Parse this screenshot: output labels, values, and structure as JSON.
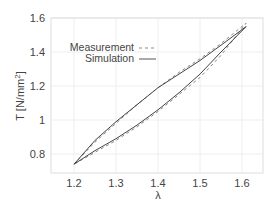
{
  "chart_data": {
    "type": "line",
    "title": "",
    "xlabel": "λ",
    "ylabel": "T [N/mm²]",
    "xlim": [
      1.15,
      1.65
    ],
    "ylim": [
      0.7,
      1.6
    ],
    "xticks": [
      "1.2",
      "1.3",
      "1.4",
      "1.5",
      "1.6"
    ],
    "yticks": [
      "0.8",
      "1",
      "1.2",
      "1.4",
      "1.6"
    ],
    "grid": true,
    "legend_position": "upper-left-inside",
    "series": [
      {
        "name": "Measurement",
        "style": "dashed",
        "loading": {
          "x": [
            1.2,
            1.25,
            1.3,
            1.35,
            1.4,
            1.45,
            1.5,
            1.55,
            1.61
          ],
          "y": [
            0.74,
            0.87,
            0.98,
            1.09,
            1.19,
            1.28,
            1.36,
            1.45,
            1.57
          ]
        },
        "unloading": {
          "x": [
            1.61,
            1.55,
            1.5,
            1.45,
            1.4,
            1.35,
            1.3,
            1.25,
            1.2
          ],
          "y": [
            1.57,
            1.38,
            1.25,
            1.15,
            1.05,
            0.96,
            0.88,
            0.81,
            0.74
          ]
        }
      },
      {
        "name": "Simulation",
        "style": "solid",
        "loading": {
          "x": [
            1.2,
            1.25,
            1.3,
            1.35,
            1.4,
            1.45,
            1.5,
            1.55,
            1.61
          ],
          "y": [
            0.74,
            0.88,
            0.99,
            1.09,
            1.19,
            1.27,
            1.35,
            1.44,
            1.55
          ]
        },
        "unloading": {
          "x": [
            1.61,
            1.55,
            1.5,
            1.45,
            1.4,
            1.35,
            1.3,
            1.25,
            1.2
          ],
          "y": [
            1.55,
            1.4,
            1.27,
            1.16,
            1.06,
            0.97,
            0.89,
            0.82,
            0.74
          ]
        }
      }
    ]
  },
  "legend": {
    "measurement": "Measurement",
    "simulation": "Simulation"
  },
  "axes": {
    "xlabel": "λ",
    "ylabel_main": "T [N/mm",
    "ylabel_sup": "2",
    "ylabel_end": "]"
  }
}
